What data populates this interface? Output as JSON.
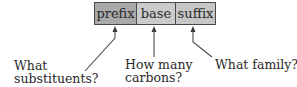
{
  "diagram": {
    "segments": [
      {
        "id": "prefix",
        "label": "prefix",
        "fill": "#a9a9a9"
      },
      {
        "id": "base",
        "label": "base",
        "fill": "#cbcbcb"
      },
      {
        "id": "suffix",
        "label": "suffix",
        "fill": "#c6c6c6"
      }
    ],
    "annotations": {
      "prefix": {
        "line1": "What",
        "line2": "substituents?"
      },
      "base": {
        "line1": "How many",
        "line2": "carbons?"
      },
      "suffix": {
        "line1": "What family?"
      }
    },
    "colors": {
      "border": "#4a4a4a",
      "arrow": "#4a4a4a",
      "text": "#2a2a2a"
    }
  }
}
